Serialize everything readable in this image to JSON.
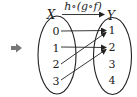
{
  "diagram": {
    "indicator_arrow": {
      "glyph": "➡",
      "color": "#777777"
    },
    "title": "h∘(g∘f)",
    "domain_set": {
      "label": "X",
      "elements": [
        "0",
        "1",
        "2",
        "3"
      ]
    },
    "codomain_set": {
      "label": "Y",
      "elements": [
        "1",
        "2",
        "3",
        "4"
      ]
    },
    "mappings": [
      {
        "from": "0",
        "to": "1"
      },
      {
        "from": "1",
        "to": "2"
      },
      {
        "from": "2",
        "to": "1"
      },
      {
        "from": "3",
        "to": "2"
      }
    ],
    "colors": {
      "stroke": "#222222"
    }
  }
}
